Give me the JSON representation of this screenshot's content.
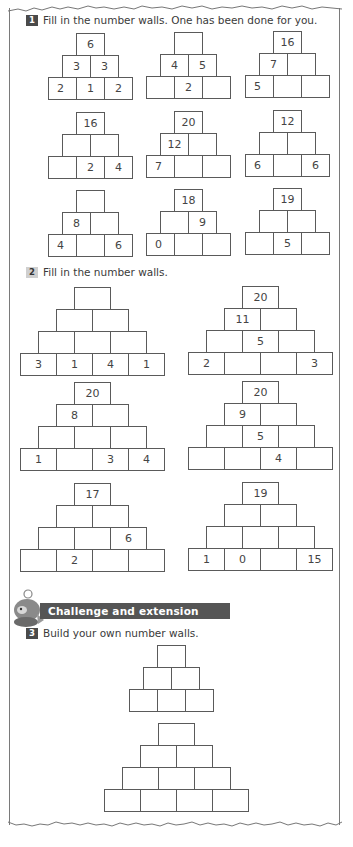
{
  "questions": [
    {
      "number": "1",
      "badge_style": "dark",
      "text": "Fill in the number walls. One has been done for you."
    },
    {
      "number": "2",
      "badge_style": "light",
      "text": "Fill in the number walls."
    },
    {
      "number": "3",
      "badge_style": "dark",
      "text": "Build your own number walls."
    }
  ],
  "challenge": {
    "title": "Challenge and extension question",
    "icon": "mascot-character-icon"
  },
  "colors": {
    "border": "#5a5a5a",
    "badge_dark": "#4a4a4a",
    "badge_light": "#cfcfcf",
    "challenge_bar": "#555555"
  },
  "walls": {
    "q1": [
      {
        "id": "q1-w1",
        "left": 48,
        "top": 33,
        "cw": 28,
        "ch": 22,
        "rows": [
          [
            "6"
          ],
          [
            "3",
            "3"
          ],
          [
            "2",
            "1",
            "2"
          ]
        ]
      },
      {
        "id": "q1-w2",
        "left": 146,
        "top": 32,
        "cw": 28,
        "ch": 22,
        "rows": [
          [
            ""
          ],
          [
            "4",
            "5"
          ],
          [
            "",
            "2",
            ""
          ]
        ]
      },
      {
        "id": "q1-w3",
        "left": 245,
        "top": 31,
        "cw": 28,
        "ch": 22,
        "rows": [
          [
            "16"
          ],
          [
            "7",
            ""
          ],
          [
            "5",
            "",
            ""
          ]
        ]
      },
      {
        "id": "q1-w4",
        "left": 48,
        "top": 112,
        "cw": 28,
        "ch": 22,
        "rows": [
          [
            "16"
          ],
          [
            "",
            ""
          ],
          [
            "",
            "2",
            "4"
          ]
        ]
      },
      {
        "id": "q1-w5",
        "left": 146,
        "top": 111,
        "cw": 28,
        "ch": 22,
        "rows": [
          [
            "20"
          ],
          [
            "12",
            ""
          ],
          [
            "7",
            "",
            ""
          ]
        ]
      },
      {
        "id": "q1-w6",
        "left": 245,
        "top": 110,
        "cw": 28,
        "ch": 22,
        "rows": [
          [
            "12"
          ],
          [
            "",
            ""
          ],
          [
            "6",
            "",
            "6"
          ]
        ]
      },
      {
        "id": "q1-w7",
        "left": 48,
        "top": 190,
        "cw": 28,
        "ch": 22,
        "rows": [
          [
            ""
          ],
          [
            "8",
            ""
          ],
          [
            "4",
            "",
            "6"
          ]
        ]
      },
      {
        "id": "q1-w8",
        "left": 146,
        "top": 189,
        "cw": 28,
        "ch": 22,
        "rows": [
          [
            "18"
          ],
          [
            "",
            "9"
          ],
          [
            "0",
            "",
            ""
          ]
        ]
      },
      {
        "id": "q1-w9",
        "left": 245,
        "top": 188,
        "cw": 28,
        "ch": 22,
        "rows": [
          [
            "19"
          ],
          [
            "",
            ""
          ],
          [
            "",
            "5",
            ""
          ]
        ]
      }
    ],
    "q2": [
      {
        "id": "q2-w1",
        "left": 20,
        "top": 287,
        "cw": 36,
        "ch": 22,
        "rows": [
          [
            ""
          ],
          [
            "",
            ""
          ],
          [
            "",
            "",
            ""
          ],
          [
            "3",
            "1",
            "4",
            "1"
          ]
        ]
      },
      {
        "id": "q2-w2",
        "left": 188,
        "top": 286,
        "cw": 36,
        "ch": 22,
        "rows": [
          [
            "20"
          ],
          [
            "11",
            ""
          ],
          [
            "",
            "5",
            ""
          ],
          [
            "2",
            "",
            "",
            "3"
          ]
        ]
      },
      {
        "id": "q2-w3",
        "left": 20,
        "top": 382,
        "cw": 36,
        "ch": 22,
        "rows": [
          [
            "20"
          ],
          [
            "8",
            ""
          ],
          [
            "",
            "",
            ""
          ],
          [
            "1",
            "",
            "3",
            "4"
          ]
        ]
      },
      {
        "id": "q2-w4",
        "left": 188,
        "top": 381,
        "cw": 36,
        "ch": 22,
        "rows": [
          [
            "20"
          ],
          [
            "9",
            ""
          ],
          [
            "",
            "5",
            ""
          ],
          [
            "",
            "",
            "4",
            ""
          ]
        ]
      },
      {
        "id": "q2-w5",
        "left": 20,
        "top": 483,
        "cw": 36,
        "ch": 22,
        "rows": [
          [
            "17"
          ],
          [
            "",
            ""
          ],
          [
            "",
            "",
            "6"
          ],
          [
            "",
            "2",
            "",
            ""
          ]
        ]
      },
      {
        "id": "q2-w6",
        "left": 188,
        "top": 482,
        "cw": 36,
        "ch": 22,
        "rows": [
          [
            "19"
          ],
          [
            "",
            ""
          ],
          [
            "",
            "",
            ""
          ],
          [
            "1",
            "0",
            "",
            "15"
          ]
        ]
      }
    ],
    "q3": [
      {
        "id": "q3-w1",
        "left": 129,
        "top": 645,
        "cw": 28,
        "ch": 22,
        "rows": [
          [
            ""
          ],
          [
            "",
            ""
          ],
          [
            "",
            "",
            ""
          ]
        ]
      },
      {
        "id": "q3-w2",
        "left": 104,
        "top": 723,
        "cw": 36,
        "ch": 22,
        "rows": [
          [
            ""
          ],
          [
            "",
            ""
          ],
          [
            "",
            "",
            ""
          ],
          [
            "",
            "",
            "",
            ""
          ]
        ]
      }
    ]
  }
}
